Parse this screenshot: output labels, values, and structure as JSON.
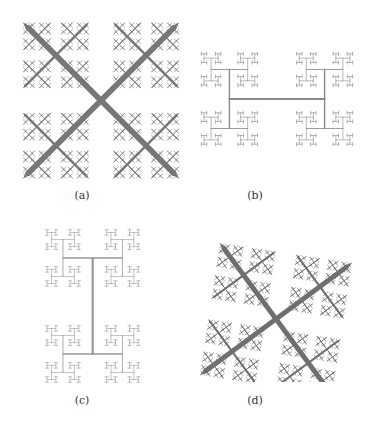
{
  "figure": {
    "panels": [
      {
        "id": "a",
        "caption": "(a)",
        "style": "dendrite-cross",
        "color": "#777777",
        "box": {
          "x": 18,
          "y": 18,
          "w": 166,
          "h": 165
        },
        "caption_pos": {
          "x": 82,
          "y": 197
        }
      },
      {
        "id": "b",
        "caption": "(b)",
        "style": "square-dendrite",
        "color": "#888888",
        "box": {
          "x": 192,
          "y": 14,
          "w": 170,
          "h": 170
        },
        "caption_pos": {
          "x": 255,
          "y": 197
        }
      },
      {
        "id": "c",
        "caption": "(c)",
        "style": "tree-dendrite",
        "color": "#999999",
        "box": {
          "x": 18,
          "y": 226,
          "w": 166,
          "h": 160
        },
        "caption_pos": {
          "x": 82,
          "y": 402
        }
      },
      {
        "id": "d",
        "caption": "(d)",
        "style": "diagonal-dendrite",
        "color": "#6f6f6f",
        "box": {
          "x": 196,
          "y": 232,
          "w": 160,
          "h": 150
        },
        "caption_pos": {
          "x": 255,
          "y": 402
        }
      }
    ]
  }
}
